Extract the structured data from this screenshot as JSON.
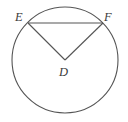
{
  "figure": {
    "background_color": "#ffffff",
    "stroke_color": "#555555",
    "label_color": "#3b3b3b",
    "labels": {
      "center": "D",
      "left_point": "E",
      "right_point": "F"
    },
    "geometry": {
      "circle": {
        "cx": 65,
        "cy": 60,
        "r": 53
      },
      "points": {
        "D": {
          "x": 65,
          "y": 60
        },
        "E": {
          "x": 28,
          "y": 23
        },
        "F": {
          "x": 103,
          "y": 23
        }
      },
      "segments": [
        {
          "name": "chord-ef",
          "from": "E",
          "to": "F"
        },
        {
          "name": "radius-de",
          "from": "D",
          "to": "E"
        },
        {
          "name": "radius-df",
          "from": "D",
          "to": "F"
        }
      ]
    }
  }
}
